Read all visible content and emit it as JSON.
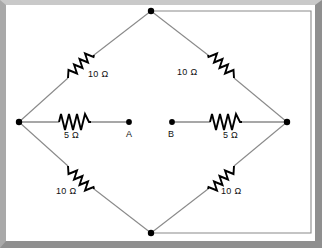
{
  "figure": {
    "kind": "circuit-diagram",
    "background_color": "#ffffff",
    "frame_color": "#a9a9a9",
    "wire_color": "#6e6e6e",
    "component_color": "#000000"
  },
  "nodes": [
    {
      "id": "top",
      "label": "",
      "x": 151,
      "y": 11
    },
    {
      "id": "left",
      "label": "",
      "x": 19,
      "y": 122
    },
    {
      "id": "right",
      "label": "",
      "x": 287,
      "y": 122
    },
    {
      "id": "bottom",
      "label": "",
      "x": 151,
      "y": 233
    },
    {
      "id": "A",
      "label": "A",
      "x": 129,
      "y": 122
    },
    {
      "id": "B",
      "label": "B",
      "x": 172,
      "y": 122
    }
  ],
  "resistors": [
    {
      "id": "r-top-left",
      "value": "10 Ω",
      "label_x": 88,
      "label_y": 75
    },
    {
      "id": "r-top-right",
      "value": "10 Ω",
      "label_x": 182,
      "label_y": 72
    },
    {
      "id": "r-bottom-left",
      "value": "10 Ω",
      "label_x": 56,
      "label_y": 191
    },
    {
      "id": "r-bottom-right",
      "value": "10 Ω",
      "label_x": 226,
      "label_y": 191
    },
    {
      "id": "r-left-mid",
      "value": "5 Ω",
      "label_x": 71,
      "label_y": 132
    },
    {
      "id": "r-right-mid",
      "value": "5 Ω",
      "label_x": 231,
      "label_y": 132
    }
  ]
}
